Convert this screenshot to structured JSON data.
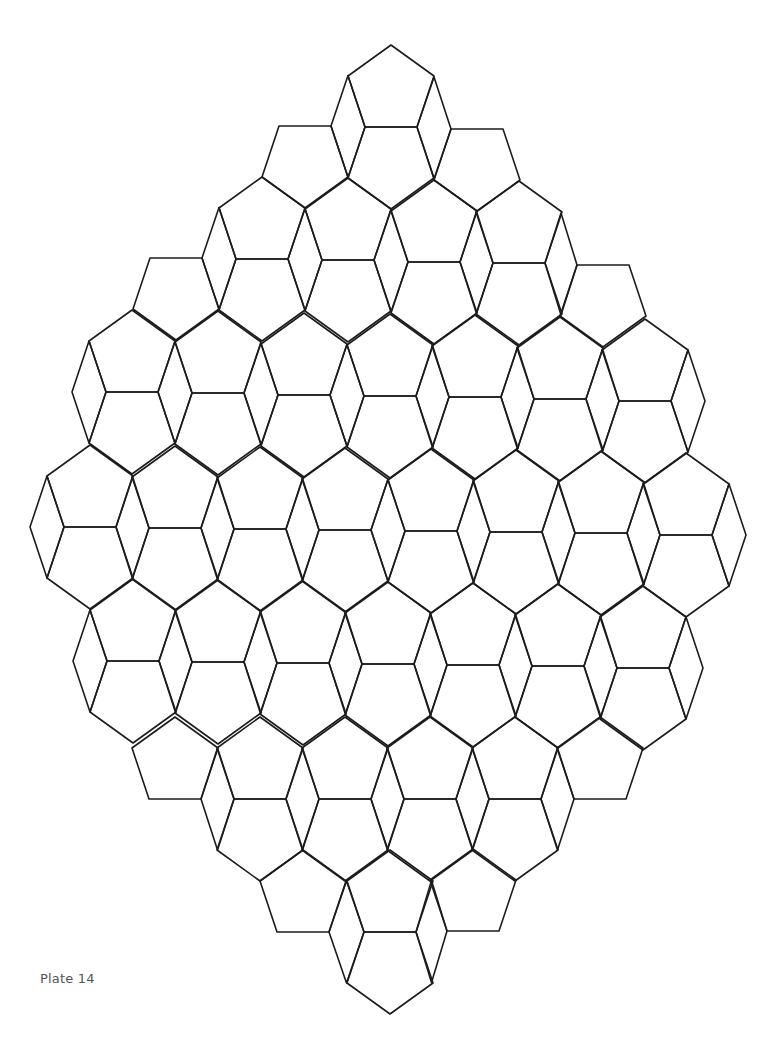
{
  "page": {
    "label": "Plate 14",
    "background": "#ffffff",
    "line_color": "#1c1c1c",
    "label_color": "#555555"
  },
  "tiling": {
    "description": "Rhombus-shaped patch of paired pentagons (one pointing up, one pointing down, sharing a horizontal edge) separated by thin rhombi",
    "pair_geometry": {
      "mid_half_width": 26,
      "shoulder_dx": 43,
      "shoulder_dy": 51,
      "apex_dy": 82,
      "rhombus_outer_dx": 60
    },
    "rows": [
      {
        "pairs": [
          [
            305,
            126,
            "B"
          ],
          [
            391,
            127,
            "TB"
          ],
          [
            477,
            129,
            "B"
          ]
        ],
        "outer_left": false,
        "outer_right": false
      },
      {
        "pairs": [
          [
            176,
            258,
            "B"
          ],
          [
            262,
            259,
            "TB"
          ],
          [
            348,
            260,
            "TB"
          ],
          [
            434,
            262,
            "TB"
          ],
          [
            519,
            263,
            "TB"
          ],
          [
            603,
            265,
            "B"
          ]
        ],
        "outer_left": false,
        "outer_right": false
      },
      {
        "pairs": [
          [
            132,
            392,
            "TB"
          ],
          [
            218,
            393,
            "TB"
          ],
          [
            304,
            395,
            "TB"
          ],
          [
            390,
            396,
            "TB"
          ],
          [
            475,
            397,
            "TB"
          ],
          [
            560,
            399,
            "TB"
          ],
          [
            645,
            401,
            "TB"
          ]
        ],
        "outer_left": true,
        "outer_right": true
      },
      {
        "pairs": [
          [
            90,
            527,
            "TB"
          ],
          [
            175,
            528,
            "TB"
          ],
          [
            260,
            529,
            "TB"
          ],
          [
            345,
            530,
            "TB"
          ],
          [
            431,
            531,
            "TB"
          ],
          [
            516,
            532,
            "TB"
          ],
          [
            601,
            533,
            "TB"
          ],
          [
            686,
            535,
            "TB"
          ]
        ],
        "outer_left": true,
        "outer_right": true
      },
      {
        "pairs": [
          [
            133,
            661,
            "TB"
          ],
          [
            218,
            662,
            "TB"
          ],
          [
            303,
            663,
            "TB"
          ],
          [
            388,
            664,
            "TB"
          ],
          [
            473,
            665,
            "TB"
          ],
          [
            558,
            666,
            "TB"
          ],
          [
            643,
            668,
            "TB"
          ]
        ],
        "outer_left": true,
        "outer_right": true
      },
      {
        "pairs": [
          [
            175,
            799,
            "T"
          ],
          [
            260,
            799,
            "TB"
          ],
          [
            345,
            799,
            "TB"
          ],
          [
            430,
            799,
            "TB"
          ],
          [
            515,
            799,
            "TB"
          ],
          [
            600,
            799,
            "T"
          ]
        ],
        "outer_left": false,
        "outer_right": false
      },
      {
        "pairs": [
          [
            303,
            932,
            "T"
          ],
          [
            390,
            932,
            "TB"
          ],
          [
            473,
            931,
            "T"
          ]
        ],
        "outer_left": false,
        "outer_right": false
      }
    ]
  }
}
